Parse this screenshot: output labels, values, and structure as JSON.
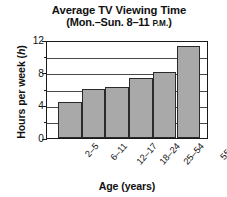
{
  "chart_data": {
    "type": "bar",
    "title": "Average TV Viewing Time",
    "subtitle_prefix": "(Mon.–Sun. 8–11 ",
    "subtitle_smallcaps": "P.M.",
    "subtitle_suffix": ")",
    "categories": [
      "2–5",
      "6–11",
      "12–17",
      "18–24",
      "25–54",
      "55 & over"
    ],
    "values": [
      4.4,
      6.0,
      6.3,
      7.3,
      8.1,
      11.3
    ],
    "xlabel": "Age (years)",
    "ylabel_prefix": "Hours per week (",
    "ylabel_italic": "h",
    "ylabel_suffix": ")",
    "ylim": [
      0,
      12
    ],
    "ytick_values": [
      0,
      2,
      4,
      6,
      8,
      10,
      12
    ],
    "ytick_labels": [
      "0",
      "",
      "4",
      "",
      "8",
      "",
      "12"
    ],
    "grid": true,
    "grid_interval": 2,
    "legend": "none",
    "bar_color": "#a9a9a9",
    "bar_edge_color": "#2a2a2a",
    "axis_color": "#1a1a1a",
    "background_color": "#ffffff"
  }
}
